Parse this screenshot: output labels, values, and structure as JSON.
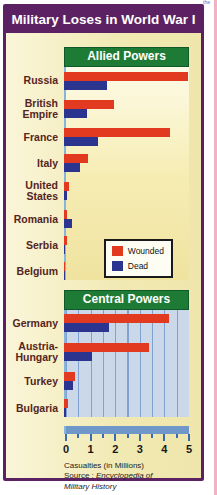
{
  "page": {
    "title": "Military Loses in World War I",
    "corner_fragment": "the",
    "colors": {
      "frame_purple": "#5c2162",
      "panel_cream": "#f1e9b2",
      "header_green": "#1e7b35",
      "wounded_red": "#e23a20",
      "dead_navy": "#2b3590",
      "axis_blue": "#7097ca",
      "label_maroon": "#55241d",
      "page_edge_pink": "#f0b3c6"
    }
  },
  "legend": {
    "items": [
      {
        "label": "Wounded",
        "color": "#e23a20"
      },
      {
        "label": "Dead",
        "color": "#2b3590"
      }
    ]
  },
  "axis": {
    "min": 0,
    "max": 5,
    "minor_step": 0.5,
    "tick_labels": [
      "0",
      "1",
      "2",
      "3",
      "4",
      "5"
    ],
    "caption": "Casualties (in Millions)",
    "source_prefix": "Source :",
    "source_name": "Encyclopedia of Military History"
  },
  "chart_data": [
    {
      "type": "bar",
      "orientation": "horizontal",
      "title": "Allied Powers",
      "categories": [
        "Russia",
        "British Empire",
        "France",
        "Italy",
        "United States",
        "Romania",
        "Serbia",
        "Belgium"
      ],
      "series": [
        {
          "name": "Wounded",
          "color": "#e23a20",
          "values": [
            4.95,
            2.0,
            4.25,
            0.95,
            0.2,
            0.12,
            0.13,
            0.05
          ]
        },
        {
          "name": "Dead",
          "color": "#2b3590",
          "values": [
            1.7,
            0.9,
            1.35,
            0.65,
            0.1,
            0.33,
            0.05,
            0.02
          ]
        }
      ],
      "xlabel": "Casualties (in Millions)",
      "xlim": [
        0,
        5
      ],
      "grid": false,
      "legend_position": "inside-bottom-right"
    },
    {
      "type": "bar",
      "orientation": "horizontal",
      "title": "Central Powers",
      "categories": [
        "Germany",
        "Austria-Hungary",
        "Turkey",
        "Bulgaria"
      ],
      "series": [
        {
          "name": "Wounded",
          "color": "#e23a20",
          "values": [
            4.2,
            3.4,
            0.45,
            0.15
          ]
        },
        {
          "name": "Dead",
          "color": "#2b3590",
          "values": [
            1.8,
            1.1,
            0.35,
            0.09
          ]
        }
      ],
      "xlabel": "Casualties (in Millions)",
      "xlim": [
        0,
        5
      ],
      "grid": true
    }
  ]
}
